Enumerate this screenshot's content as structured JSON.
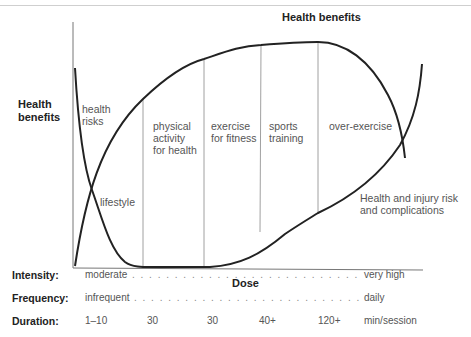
{
  "diagram": {
    "top_title": "Health benefits",
    "y_axis_title_line1": "Health",
    "y_axis_title_line2": "benefits",
    "x_axis_title": "Dose",
    "curves": {
      "benefit_label": "Health benefits",
      "risk_label_line1": "Health and injury risk",
      "risk_label_line2": "and complications"
    },
    "zones": [
      {
        "line1": "health",
        "line2": "risks",
        "line3": ""
      },
      {
        "line1": "lifestyle",
        "line2": "",
        "line3": ""
      },
      {
        "line1": "physical",
        "line2": "activity",
        "line3": "for health"
      },
      {
        "line1": "exercise",
        "line2": "for fitness",
        "line3": ""
      },
      {
        "line1": "sports",
        "line2": "training",
        "line3": ""
      },
      {
        "line1": "over-exercise",
        "line2": "",
        "line3": ""
      }
    ],
    "colors": {
      "curve": "#222222",
      "axis": "#777777",
      "divider": "#888888",
      "text": "#555555"
    }
  },
  "legend": {
    "intensity": {
      "label": "Intensity:",
      "start": "moderate",
      "end": "very high"
    },
    "frequency": {
      "label": "Frequency:",
      "start": "infrequent",
      "end": "daily"
    },
    "duration": {
      "label": "Duration:",
      "values": [
        "1–10",
        "30",
        "30",
        "40+",
        "120+"
      ],
      "unit": "min/session"
    }
  },
  "dots": ". . . . . . . . . . . . . . . . . . . . . . . . . . . . . . . . . . . . . . . . . . . . . . . . . . . . . . . . ."
}
